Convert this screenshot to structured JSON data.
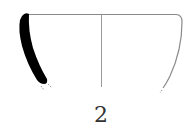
{
  "figure": {
    "label": "2",
    "type": "pottery-profile-drawing",
    "colors": {
      "section_fill": "#000000",
      "outline": "#8a8a8a",
      "axis": "#9a9a9a",
      "background": "#ffffff",
      "label": "#333333"
    }
  }
}
